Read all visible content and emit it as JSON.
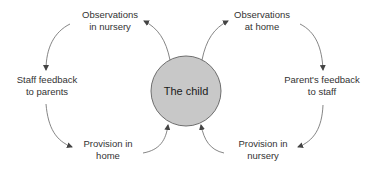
{
  "diagram": {
    "center": {
      "label": "The child",
      "fill": "#c8c8c8",
      "stroke": "#6e6e6e"
    },
    "nodes": [
      {
        "id": "obs-nursery",
        "line1": "Observations",
        "line2": "in nursery"
      },
      {
        "id": "obs-home",
        "line1": "Observations",
        "line2": "at home"
      },
      {
        "id": "staff-feedback",
        "line1": "Staff feedback",
        "line2": "to parents"
      },
      {
        "id": "parent-feedback",
        "line1": "Parent's feedback",
        "line2": "to staff"
      },
      {
        "id": "prov-home",
        "line1": "Provision in",
        "line2": "home"
      },
      {
        "id": "prov-nursery",
        "line1": "Provision in",
        "line2": "nursery"
      }
    ],
    "edges": [
      {
        "from": "The child",
        "to": "Observations in nursery"
      },
      {
        "from": "The child",
        "to": "Observations at home"
      },
      {
        "from": "Observations in nursery",
        "to": "Staff feedback to parents"
      },
      {
        "from": "Staff feedback to parents",
        "to": "Provision in home"
      },
      {
        "from": "Provision in home",
        "to": "The child"
      },
      {
        "from": "Observations at home",
        "to": "Parent's feedback to staff"
      },
      {
        "from": "Parent's feedback to staff",
        "to": "Provision in nursery"
      },
      {
        "from": "Provision in nursery",
        "to": "The child"
      }
    ],
    "arrow_color": "#555555"
  }
}
